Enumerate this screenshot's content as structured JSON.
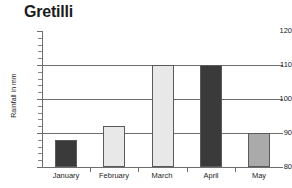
{
  "chart_data": {
    "type": "bar",
    "title": "Gretilli",
    "xlabel": "",
    "ylabel": "Rainfall in mm",
    "categories": [
      "January",
      "February",
      "March",
      "April",
      "May"
    ],
    "values": [
      88,
      92,
      110,
      110,
      90
    ],
    "ylim": [
      80,
      120
    ],
    "ytick_labels": [
      "80",
      "90",
      "100",
      "110",
      "120"
    ],
    "ytick_values": [
      80,
      90,
      100,
      110,
      120
    ],
    "minor_tick_step": 2,
    "grid": true,
    "gridlines_at": [
      90,
      100,
      110
    ],
    "legend": null,
    "bar_colors": [
      "#3a3a3a",
      "#e8e8e8",
      "#e8e8e8",
      "#3a3a3a",
      "#aaaaaa"
    ],
    "bar_border_color": "#5a5a5a",
    "axis_color": "#6e6e6e",
    "text_color": "#1c1c1c",
    "background": "#ffffff"
  }
}
